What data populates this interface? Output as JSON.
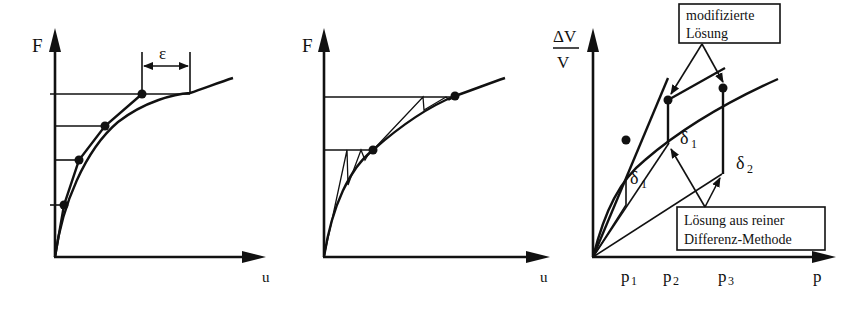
{
  "figure": {
    "colors": {
      "ink": "#111111",
      "background": "#ffffff"
    },
    "panels": [
      {
        "id": "left",
        "y_axis_label": "F",
        "x_axis_label": "u",
        "annotation": "ε",
        "description": "Incremental load steps with accumulating drift ε from true curve"
      },
      {
        "id": "middle",
        "y_axis_label": "F",
        "x_axis_label": "u",
        "description": "Newton-Raphson style iterations converging onto the curve"
      },
      {
        "id": "right",
        "y_axis_label_num": "ΔV",
        "y_axis_label_den": "V",
        "x_axis_label": "p",
        "x_ticks": [
          "p",
          "p",
          "p"
        ],
        "x_tick_subs": [
          "1",
          "2",
          "3"
        ],
        "delta_labels": [
          {
            "base": "δ",
            "sub": "1"
          },
          {
            "base": "δ",
            "sub": "1"
          },
          {
            "base": "δ",
            "sub": "2"
          }
        ],
        "box_top": {
          "line1": "modifizierte",
          "line2": "Lösung"
        },
        "box_bottom": {
          "line1": "Lösung aus reiner",
          "line2": "Differenz-Methode"
        }
      }
    ]
  }
}
